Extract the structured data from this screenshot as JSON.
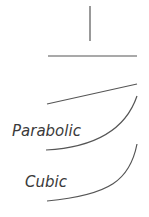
{
  "diagram": {
    "stroke_color": "#555555",
    "shapes": [
      {
        "name": "vertical-line",
        "type": "line",
        "x1": 90,
        "y1": 6,
        "x2": 90,
        "y2": 41
      },
      {
        "name": "horizontal-line",
        "type": "line",
        "x1": 48,
        "y1": 56,
        "x2": 137,
        "y2": 56
      },
      {
        "name": "linear-line",
        "type": "line",
        "x1": 47,
        "y1": 104,
        "x2": 137,
        "y2": 84
      },
      {
        "name": "parabolic-curve",
        "type": "curve",
        "d": "M46,150 Q120,146 137,96"
      },
      {
        "name": "cubic-curve",
        "type": "curve",
        "d": "M47,201 C110,195 130,180 137,144"
      }
    ],
    "labels": {
      "parabolic": "Parabolic",
      "cubic": "Cubic"
    }
  }
}
